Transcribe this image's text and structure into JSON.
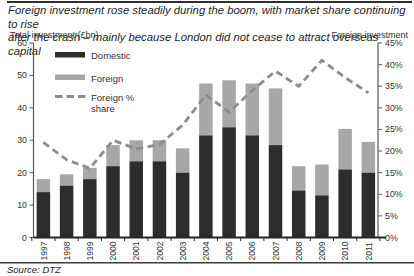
{
  "title": {
    "line1": "Foreign investment rose steadily during the boom, with market share continuing to rise",
    "line2": "after the crash – mainly because London did not cease to attract overseas capital"
  },
  "source": {
    "text": "Source: DTZ"
  },
  "colors": {
    "domestic_bar": "#2d2d2d",
    "foreign_bar": "#a7a7a7",
    "share_line": "#8c8c8c",
    "axis_line": "#595959",
    "baseline": "#262626",
    "text": "#333333"
  },
  "chart_data": {
    "type": "bar",
    "stacked": true,
    "grid": false,
    "legend_position": "top-left-inside",
    "title": "Foreign investment rose steadily during the boom, with market share continuing to rise after the crash – mainly because London did not cease to attract overseas capital",
    "categories": [
      "1997",
      "1998",
      "1999",
      "2000",
      "2001",
      "2002",
      "2003",
      "2004",
      "2005",
      "2006",
      "2007",
      "2008",
      "2009",
      "2010",
      "2011"
    ],
    "series": [
      {
        "name": "Domestic",
        "color": "#2d2d2d",
        "values": [
          14,
          16,
          18,
          22,
          23.5,
          23.5,
          20,
          31.5,
          34,
          31.5,
          28.5,
          14.5,
          13,
          21,
          20
        ]
      },
      {
        "name": "Foreign",
        "color": "#a7a7a7",
        "values": [
          4,
          3.5,
          3.5,
          6.5,
          6.5,
          6.5,
          7.5,
          16,
          14.5,
          16,
          17.5,
          7.5,
          9.5,
          12.5,
          9.5
        ]
      }
    ],
    "line_series": {
      "name": "Foreign % share",
      "axis": "right",
      "style": "dashed",
      "color": "#8c8c8c",
      "values": [
        22,
        18,
        16,
        22.5,
        20.5,
        21.5,
        26,
        33,
        29,
        34,
        38.5,
        35,
        41,
        37,
        33.5
      ]
    },
    "left_axis": {
      "label": "Total investment (£bn)",
      "min": 0,
      "max": 60,
      "tick_step": 10,
      "ticks": [
        "0",
        "10",
        "20",
        "30",
        "40",
        "50",
        "60"
      ]
    },
    "right_axis": {
      "label": "Foreign investment",
      "min": 0,
      "max": 45,
      "tick_step": 5,
      "ticks": [
        "0%",
        "5%",
        "10%",
        "15%",
        "20%",
        "25%",
        "30%",
        "35%",
        "40%",
        "45%"
      ]
    },
    "legend": [
      {
        "label_lines": [
          "Domestic"
        ],
        "swatch": "box",
        "color": "#2d2d2d"
      },
      {
        "label_lines": [
          "Foreign"
        ],
        "swatch": "box",
        "color": "#a7a7a7"
      },
      {
        "label_lines": [
          "Foreign %",
          "share"
        ],
        "swatch": "dash",
        "color": "#8c8c8c"
      }
    ]
  }
}
